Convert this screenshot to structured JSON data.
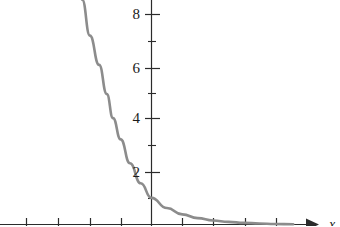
{
  "chart_data": {
    "type": "line",
    "title": "",
    "subtitle": "",
    "xlabel": "x",
    "ylabel": "",
    "grid": false,
    "legend": null,
    "curve_color": "#8c8c8c",
    "axis_color": "#2b2b2b",
    "label_color": "#1a1a1a",
    "background_color": "#ffffff",
    "xlim": [
      -4.75,
      5.6
    ],
    "ylim": [
      -0.1,
      8.45
    ],
    "x_ticks_major": [
      -4,
      -3,
      -2,
      -1,
      0,
      1,
      2,
      3,
      4
    ],
    "x_tick_labels": [
      "",
      "",
      "",
      "",
      "",
      "",
      "",
      "",
      ""
    ],
    "y_ticks_major": [
      2,
      4,
      6,
      8
    ],
    "y_tick_labels": [
      "2",
      "4",
      "6",
      "8"
    ],
    "y_ticks_minor": [
      1,
      3,
      5,
      7
    ],
    "x_axis_arrow": true,
    "y_axis_arrow": false,
    "series": [
      {
        "name": "decaying exponential",
        "values": [
          {
            "x": -2.25,
            "y": 8.45
          },
          {
            "x": -2.0,
            "y": 7.1
          },
          {
            "x": -1.7,
            "y": 6.0
          },
          {
            "x": -1.45,
            "y": 4.9
          },
          {
            "x": -1.25,
            "y": 4.0
          },
          {
            "x": -1.0,
            "y": 3.2
          },
          {
            "x": -0.7,
            "y": 2.3
          },
          {
            "x": -0.35,
            "y": 1.55
          },
          {
            "x": 0.0,
            "y": 1.0
          },
          {
            "x": 0.5,
            "y": 0.62
          },
          {
            "x": 1.0,
            "y": 0.38
          },
          {
            "x": 1.5,
            "y": 0.24
          },
          {
            "x": 2.0,
            "y": 0.15
          },
          {
            "x": 2.5,
            "y": 0.1
          },
          {
            "x": 3.0,
            "y": 0.06
          },
          {
            "x": 3.5,
            "y": 0.04
          },
          {
            "x": 4.0,
            "y": 0.02
          },
          {
            "x": 4.6,
            "y": 0.01
          }
        ]
      }
    ]
  },
  "axis_labels": {
    "x_axis": "x"
  },
  "y_labels": {
    "t8": "8",
    "t6": "6",
    "t4": "4",
    "t2": "2"
  }
}
